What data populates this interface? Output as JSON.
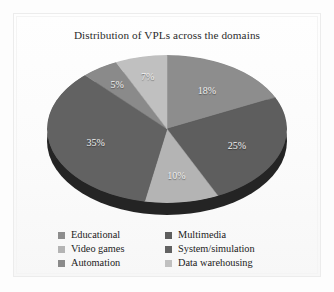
{
  "chart_data": {
    "type": "pie",
    "title": "Distribution of VPLs across the domains",
    "xlabel": "",
    "ylabel": "",
    "legend_position": "bottom",
    "grid": false,
    "categories": [
      "Educational",
      "Multimedia",
      "Video games",
      "System/simulation",
      "Automation",
      "Data warehousing"
    ],
    "values": [
      18,
      25,
      10,
      35,
      5,
      7
    ],
    "unit": "%",
    "data_labels": [
      "18%",
      "25%",
      "10%",
      "35%",
      "5%",
      "7%"
    ],
    "colors": [
      "#8d8d8d",
      "#5e5e5e",
      "#b4b4b4",
      "#626262",
      "#8a8a8a",
      "#c0c0c0"
    ],
    "slices": [
      {
        "label": "Educational",
        "value": 18,
        "display": "18%",
        "color": "#8d8d8d",
        "start_deg": 0,
        "end_deg": 64.8
      },
      {
        "label": "Multimedia",
        "value": 25,
        "display": "25%",
        "color": "#5e5e5e",
        "start_deg": 64.8,
        "end_deg": 154.8
      },
      {
        "label": "Video games",
        "value": 10,
        "display": "10%",
        "color": "#b4b4b4",
        "start_deg": 154.8,
        "end_deg": 190.8
      },
      {
        "label": "System/simulation",
        "value": 35,
        "display": "35%",
        "color": "#626262",
        "start_deg": 190.8,
        "end_deg": 316.8
      },
      {
        "label": "Automation",
        "value": 5,
        "display": "5%",
        "color": "#8a8a8a",
        "start_deg": 316.8,
        "end_deg": 334.8
      },
      {
        "label": "Data warehousing",
        "value": 7,
        "display": "7%",
        "color": "#c0c0c0",
        "start_deg": 334.8,
        "end_deg": 360
      }
    ],
    "depth_color": "#242424"
  },
  "legend": {
    "left_column": [
      {
        "label": "Educational",
        "color": "#8d8d8d"
      },
      {
        "label": "Video games",
        "color": "#b4b4b4"
      },
      {
        "label": "Automation",
        "color": "#8a8a8a"
      }
    ],
    "right_column": [
      {
        "label": "Multimedia",
        "color": "#5e5e5e"
      },
      {
        "label": "System/simulation",
        "color": "#626262"
      },
      {
        "label": "Data warehousing",
        "color": "#c0c0c0"
      }
    ]
  }
}
